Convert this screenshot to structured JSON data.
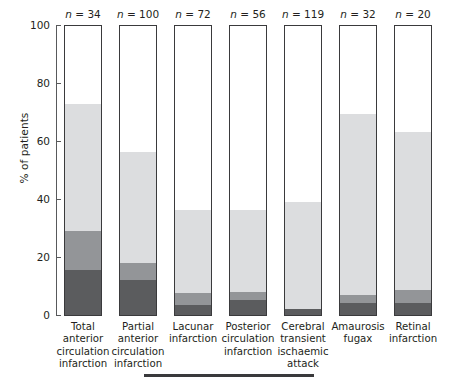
{
  "chart_data": {
    "type": "bar",
    "subtype": "stacked-bar",
    "title": "",
    "xlabel": "",
    "ylabel": "% of patients",
    "ylim": [
      0,
      100
    ],
    "yticks": [
      0,
      20,
      40,
      60,
      80,
      100
    ],
    "ytick_labels": [
      "0",
      "20",
      "40",
      "60",
      "80",
      "100"
    ],
    "grid": false,
    "legend": "none",
    "stack_order": "bottom-to-top",
    "categories": [
      "Total anterior circulation infarction",
      "Partial anterior circulation infarction",
      "Lacunar infarction",
      "Posterior circulation infarction",
      "Cerebral transient ischaemic attack",
      "Amaurosis fugax",
      "Retinal infarction"
    ],
    "category_lines": [
      [
        "Total",
        "anterior",
        "circulation",
        "infarction"
      ],
      [
        "Partial",
        "anterior",
        "circulation",
        "infarction"
      ],
      [
        "Lacunar",
        "infarction"
      ],
      [
        "Posterior",
        "circulation",
        "infarction"
      ],
      [
        "Cerebral",
        "transient",
        "ischaemic",
        "attack"
      ],
      [
        "Amaurosis",
        "fugax"
      ],
      [
        "Retinal",
        "infarction"
      ]
    ],
    "n_labels": [
      "n = 34",
      "n = 100",
      "n = 72",
      "n = 56",
      "n = 119",
      "n = 32",
      "n = 20"
    ],
    "n_values": [
      34,
      100,
      72,
      56,
      119,
      32,
      20
    ],
    "series": [
      {
        "name": "dark",
        "color": "#5b5c5e",
        "values": [
          15.5,
          12.0,
          3.5,
          5.0,
          2.0,
          4.0,
          4.0
        ]
      },
      {
        "name": "medium",
        "color": "#939598",
        "values": [
          13.5,
          6.0,
          4.0,
          3.0,
          0.0,
          3.0,
          4.5
        ]
      },
      {
        "name": "light",
        "color": "#dcdddf",
        "values": [
          43.5,
          38.0,
          28.5,
          28.0,
          37.0,
          62.0,
          54.5
        ]
      }
    ],
    "segment_tops_percent": [
      72.5,
      56.0,
      36.0,
      36.0,
      39.0,
      69.0,
      63.0
    ],
    "bar_outline_color": "#3a3a3c",
    "axis_color": "#58595b",
    "background": "#ffffff"
  }
}
